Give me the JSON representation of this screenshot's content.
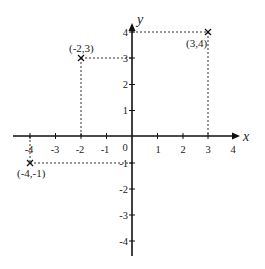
{
  "diagram": {
    "type": "cartesian-plane",
    "axes": {
      "x_label": "x",
      "y_label": "y",
      "origin_label": "0",
      "x_ticks": [
        "-4",
        "-3",
        "-2",
        "-1",
        "1",
        "2",
        "3",
        "4"
      ],
      "y_ticks": [
        "4",
        "3",
        "2",
        "1",
        "-1",
        "-2",
        "-3",
        "-4"
      ]
    },
    "points": [
      {
        "x": -2,
        "y": 3,
        "label": "(-2,3)"
      },
      {
        "x": 3,
        "y": 4,
        "label": "(3,4)"
      },
      {
        "x": -4,
        "y": -1,
        "label": "(-4,-1)"
      }
    ],
    "colors": {
      "axis": "#111111",
      "dashed": "#333333",
      "text": "#222222"
    }
  }
}
